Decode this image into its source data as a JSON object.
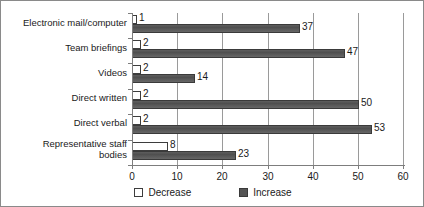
{
  "chart_data": {
    "type": "bar",
    "orientation": "horizontal",
    "title": "",
    "xlabel": "",
    "ylabel": "",
    "xlim": [
      0,
      60
    ],
    "xticks": [
      0,
      10,
      20,
      30,
      40,
      50,
      60
    ],
    "grid": "vertical",
    "legend_position": "bottom-center",
    "categories": [
      "Electronic mail/computer",
      "Team briefings",
      "Videos",
      "Direct written",
      "Direct verbal",
      "Representative staff bodies"
    ],
    "series": [
      {
        "name": "Decrease",
        "color": "#ffffff",
        "values": [
          1,
          2,
          2,
          2,
          2,
          8
        ]
      },
      {
        "name": "Increase",
        "color": "#555555",
        "values": [
          37,
          47,
          14,
          50,
          53,
          23
        ]
      }
    ]
  },
  "categories": [
    {
      "label_line1": "Electronic mail/computer",
      "label_line2": ""
    },
    {
      "label_line1": "Team briefings",
      "label_line2": ""
    },
    {
      "label_line1": "Videos",
      "label_line2": ""
    },
    {
      "label_line1": "Direct written",
      "label_line2": ""
    },
    {
      "label_line1": "Direct verbal",
      "label_line2": ""
    },
    {
      "label_line1": "Representative staff",
      "label_line2": "bodies"
    }
  ],
  "axis": {
    "tick_labels": [
      "0",
      "10",
      "20",
      "30",
      "40",
      "50",
      "60"
    ]
  },
  "bar_values": {
    "decrease": [
      "1",
      "2",
      "2",
      "2",
      "2",
      "8"
    ],
    "increase": [
      "37",
      "47",
      "14",
      "50",
      "53",
      "23"
    ]
  },
  "legend": {
    "items": [
      {
        "label": "Decrease",
        "swatch": "decrease"
      },
      {
        "label": "Increase",
        "swatch": "increase"
      }
    ]
  }
}
